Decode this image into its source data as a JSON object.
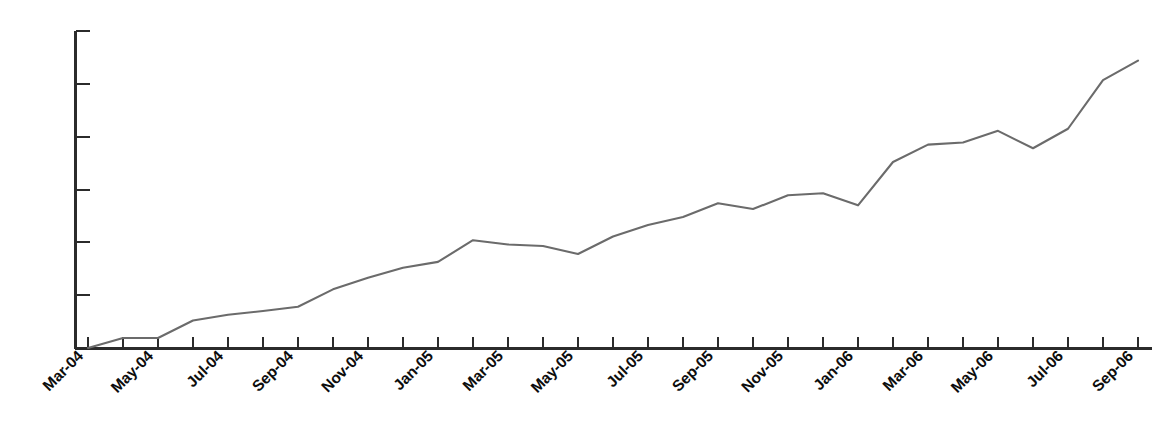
{
  "chart_data": {
    "type": "line",
    "title": "",
    "subtitle": "",
    "xlabel": "",
    "ylabel": "",
    "grid": false,
    "legend": false,
    "legend_position": "none",
    "line_color": "#6b6b6b",
    "axis_color": "#2b2b2b",
    "background": "#ffffff",
    "y_axis": {
      "labels_shown": false,
      "tick_count": 6,
      "tick_labels": [],
      "ylim": [
        0,
        6
      ]
    },
    "x_axis": {
      "label_interval_months": 2,
      "label_rotation_deg": -45,
      "tick_count": 31
    },
    "categories": [
      "Mar-04",
      "Apr-04",
      "May-04",
      "Jun-04",
      "Jul-04",
      "Aug-04",
      "Sep-04",
      "Oct-04",
      "Nov-04",
      "Dec-04",
      "Jan-05",
      "Feb-05",
      "Mar-05",
      "Apr-05",
      "May-05",
      "Jun-05",
      "Jul-05",
      "Aug-05",
      "Sep-05",
      "Oct-05",
      "Nov-05",
      "Dec-05",
      "Jan-06",
      "Feb-06",
      "Mar-06",
      "Apr-06",
      "May-06",
      "Jun-06",
      "Jul-06",
      "Aug-06",
      "Sep-06"
    ],
    "tick_labels_visible": [
      "Mar-04",
      "May-04",
      "Jul-04",
      "Sep-04",
      "Nov-04",
      "Jan-05",
      "Mar-05",
      "May-05",
      "Jul-05",
      "Sep-05",
      "Nov-05",
      "Jan-06",
      "Mar-06",
      "May-06",
      "Jul-06",
      "Sep-06"
    ],
    "values": [
      0.0,
      0.19,
      0.19,
      0.52,
      0.63,
      0.7,
      0.78,
      1.11,
      1.33,
      1.52,
      1.63,
      2.04,
      1.96,
      1.93,
      1.78,
      2.11,
      2.33,
      2.48,
      2.74,
      2.63,
      2.89,
      2.93,
      2.7,
      3.52,
      3.85,
      3.89,
      4.11,
      3.78,
      4.15,
      5.07,
      5.44
    ]
  }
}
